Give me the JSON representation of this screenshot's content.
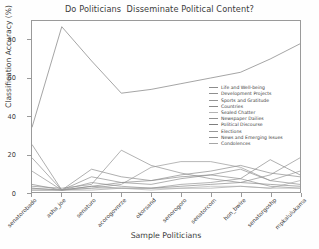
{
  "chart_data": {
    "type": "line",
    "title": "Do Politicians  Disseminate Political Content?",
    "xlabel": "Sample Politicians",
    "ylabel": "Classification Accuracy (%)",
    "ylim": [
      0,
      90
    ],
    "xlim": [
      0,
      9
    ],
    "grid": false,
    "legend_position": "center-right",
    "yticks": [
      "0",
      "20",
      "40",
      "60",
      "80"
    ],
    "ytick_values": [
      0,
      20,
      40,
      60,
      80
    ],
    "categories": [
      "senatorobado",
      "asha_joe",
      "senaturo",
      "acorogovnrze",
      "okorsand",
      "senorogoro",
      "senatorcom",
      "hon_bwire",
      "senatorgoshp",
      "mpkalulukama"
    ],
    "series": [
      {
        "name": "Life and Well-being",
        "color": "#8c8c8c",
        "values": [
          25,
          1,
          12,
          8,
          6,
          9,
          11,
          14,
          10,
          8
        ]
      },
      {
        "name": "Development  Projects",
        "color": "#8f8f8f",
        "values": [
          18,
          1,
          8,
          5,
          4,
          7,
          9,
          12,
          6,
          4
        ]
      },
      {
        "name": "Sports and  Gratitude",
        "color": "#949494",
        "values": [
          11,
          1,
          5,
          3,
          2,
          4,
          5,
          7,
          3,
          2
        ]
      },
      {
        "name": "Countries",
        "color": "#8a8a8a",
        "values": [
          4,
          1,
          3,
          2,
          2,
          3,
          4,
          5,
          4,
          3
        ]
      },
      {
        "name": "Sealed Chatter",
        "color": "#b4b4b4",
        "values": [
          2,
          1,
          2,
          2,
          1,
          2,
          3,
          3,
          2,
          2
        ]
      },
      {
        "name": "Newspaper Dailies",
        "color": "#909090",
        "values": [
          3,
          2,
          4,
          22,
          14,
          10,
          7,
          5,
          9,
          18
        ]
      },
      {
        "name": "Political Discourse",
        "color": "#7e7e7e",
        "values": [
          34,
          87,
          69,
          52,
          54,
          57,
          60,
          63,
          70,
          78
        ]
      },
      {
        "name": "Elections",
        "color": "#989898",
        "values": [
          1,
          1,
          2,
          4,
          13,
          16,
          16,
          13,
          6,
          11
        ]
      },
      {
        "name": "News and Emerging  Issues",
        "color": "#8d8d8d",
        "values": [
          2,
          1,
          3,
          5,
          6,
          8,
          9,
          7,
          17,
          9
        ]
      },
      {
        "name": "Condolences",
        "color": "#a6a6a6",
        "values": [
          1,
          1,
          1,
          2,
          2,
          2,
          2,
          3,
          2,
          6
        ]
      }
    ]
  },
  "axes": {
    "frame_color": "#9a9a9a"
  }
}
